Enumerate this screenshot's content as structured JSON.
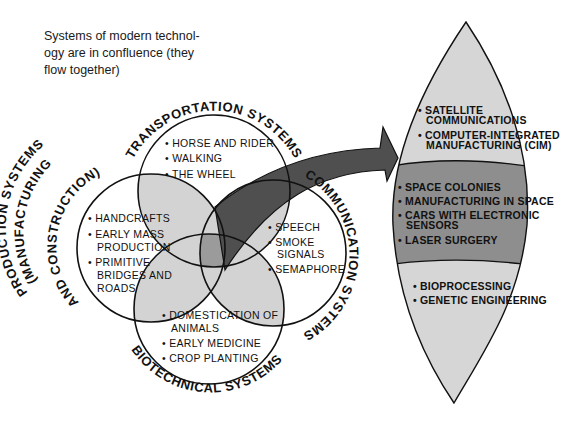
{
  "caption": {
    "lines": [
      "Systems of modern technol-",
      "ogy are in confluence (they",
      "flow together)"
    ]
  },
  "colors": {
    "light_overlap": "#d3d3d3",
    "center_overlap": "#9b9b9b",
    "arrow": "#4f4f4f",
    "lens_light": "#d6d6d6",
    "lens_dark": "#8e8e8e",
    "outline": "#111111"
  },
  "systems": {
    "transportation": {
      "label": "TRANSPORTATION SYSTEMS",
      "items": [
        "• HORSE AND RIDER",
        "• WALKING",
        "• THE WHEEL"
      ]
    },
    "production": {
      "label_lines": [
        "PRODUCTION SYSTEMS",
        "(MANUFACTURING",
        "AND CONSTRUCTION)"
      ],
      "items": [
        "• HANDCRAFTS",
        "• EARLY MASS",
        "PRODUCTION",
        "• PRIMITIVE",
        "BRIDGES AND",
        "ROADS"
      ]
    },
    "communication": {
      "label": "COMMUNICATION SYSTEMS",
      "items": [
        "• SPEECH",
        "• SMOKE",
        "SIGNALS",
        "• SEMAPHORE"
      ]
    },
    "biotechnical": {
      "label": "BIOTECHNICAL SYSTEMS",
      "items": [
        "• DOMESTICATION OF",
        "ANIMALS",
        "• EARLY MEDICINE",
        "• CROP PLANTING"
      ]
    }
  },
  "lens": {
    "top_band": [
      "• SATELLITE",
      "COMMUNICATIONS",
      "• COMPUTER-INTEGRATED",
      "MANUFACTURING (CIM)"
    ],
    "middle_band": [
      "• SPACE COLONIES",
      "• MANUFACTURING IN SPACE",
      "• CARS WITH ELECTRONIC",
      "SENSORS",
      "• LASER SURGERY"
    ],
    "bottom_band": [
      "• BIOPROCESSING",
      "• GENETIC ENGINEERING"
    ]
  }
}
